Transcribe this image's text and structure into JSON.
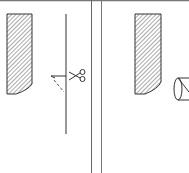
{
  "figure": {
    "panels": [
      {
        "id": "left",
        "elements": [
          "hatched-strip",
          "vertical-guide-line",
          "scissors-icon",
          "dashed-cut-line"
        ]
      },
      {
        "id": "right",
        "elements": [
          "hatched-strip",
          "cylinder-roller"
        ]
      }
    ],
    "colors": {
      "line": "#333333",
      "hatch": "#555555",
      "border": "#888888",
      "background": "#ffffff"
    }
  }
}
